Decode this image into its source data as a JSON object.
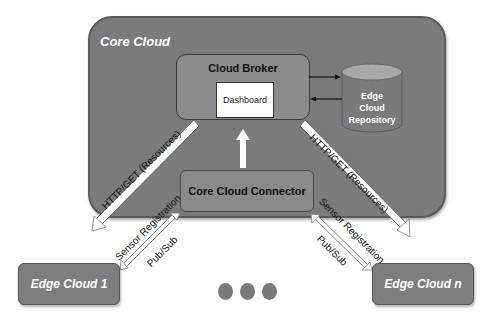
{
  "diagram": {
    "core_cloud": {
      "label": "Core Cloud"
    },
    "cloud_broker": {
      "label": "Cloud Broker",
      "dashboard_label": "Dashboard"
    },
    "repository": {
      "line1": "Edge",
      "line2": "Cloud",
      "line3": "Repository"
    },
    "connector": {
      "label": "Core Cloud Connector"
    },
    "edge_clouds": [
      {
        "label": "Edge Cloud 1"
      },
      {
        "label": "Edge Cloud n"
      }
    ],
    "links": {
      "left_http": "HTTP/GET (Resources)",
      "right_http": "HTTP/GET (Resources)",
      "left_sensor": "Sensor Registration",
      "left_pubsub": "Pub/Sub",
      "right_sensor": "Sensor Registration",
      "right_pubsub": "Pub/Sub"
    },
    "ellipsis_dots": 3,
    "colors": {
      "core_fill": "#7b7b7b",
      "box_fill": "#8a8a8a",
      "edge_fill": "#7e7e7e",
      "repo_fill": "#7a7a7a",
      "repo_top": "#a8a8a8",
      "arrow_fill": "#ffffff"
    }
  }
}
